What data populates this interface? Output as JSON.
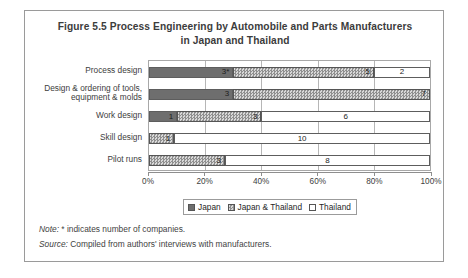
{
  "figure": {
    "title_line1": "Figure 5.5 Process Engineering by Automobile and Parts Manufacturers",
    "title_line2": "in Japan and Thailand"
  },
  "legend": {
    "items": [
      {
        "label": "Japan",
        "key": "japan",
        "swatch": "solid-dark"
      },
      {
        "label": "Japan & Thailand",
        "key": "japan_thailand",
        "swatch": "checkered"
      },
      {
        "label": "Thailand",
        "key": "thailand",
        "swatch": "white"
      }
    ]
  },
  "notes": {
    "note_lead": "Note:",
    "note_text": " * indicates number of companies.",
    "source_lead": "Source:",
    "source_text": " Compiled from authors' interviews with manufacturers."
  },
  "colors": {
    "japan": "#6e6e6e",
    "japan_thailand": "#b9b9b9",
    "thailand": "#ffffff",
    "frame": "#9a9a9a",
    "gridline": "#b6b6b6",
    "text": "#3d3d3d"
  },
  "chart_data": {
    "type": "bar",
    "orientation": "horizontal",
    "stacked": true,
    "normalized": true,
    "title": "Figure 5.5 Process Engineering by Automobile and Parts Manufacturers in Japan and Thailand",
    "xlabel": "",
    "ylabel": "",
    "xlim": [
      0,
      100
    ],
    "xticks": [
      0,
      20,
      40,
      60,
      80,
      100
    ],
    "xtick_labels": [
      "0%",
      "20%",
      "40%",
      "60%",
      "80%",
      "100%"
    ],
    "grid": true,
    "legend_position": "bottom-center",
    "categories": [
      "Process design",
      "Design & ordering of tools, equipment & molds",
      "Work design",
      "Skill design",
      "Pilot runs"
    ],
    "category_labels_wrapped": [
      [
        "Process design"
      ],
      [
        "Design & ordering of tools,",
        "equipment & molds"
      ],
      [
        "Work design"
      ],
      [
        "Skill design"
      ],
      [
        "Pilot runs"
      ]
    ],
    "series": [
      {
        "name": "Japan",
        "values": [
          3,
          3,
          1,
          0,
          0
        ],
        "labels": [
          "3*",
          "3",
          "1",
          "",
          ""
        ],
        "percent": [
          30,
          30,
          10,
          0,
          0
        ]
      },
      {
        "name": "Japan & Thailand",
        "values": [
          5,
          7,
          3,
          1,
          3
        ],
        "labels": [
          "5",
          "7",
          "3",
          "1",
          "3"
        ],
        "percent": [
          50,
          70,
          30,
          9,
          27
        ]
      },
      {
        "name": "Thailand",
        "values": [
          2,
          0,
          6,
          10,
          8
        ],
        "labels": [
          "2",
          "",
          "6",
          "10",
          "8"
        ],
        "percent": [
          20,
          0,
          60,
          91,
          73
        ]
      }
    ],
    "rows": [
      {
        "category": "Process design",
        "japan": "3*",
        "japan_thailand": "5",
        "thailand": "2",
        "total": 10
      },
      {
        "category": "Design & ordering of tools, equipment & molds",
        "japan": "3",
        "japan_thailand": "7",
        "thailand": "",
        "total": 10
      },
      {
        "category": "Work design",
        "japan": "1",
        "japan_thailand": "3",
        "thailand": "6",
        "total": 10
      },
      {
        "category": "Skill design",
        "japan": "",
        "japan_thailand": "1",
        "thailand": "10",
        "total": 11
      },
      {
        "category": "Pilot runs",
        "japan": "",
        "japan_thailand": "3",
        "thailand": "8",
        "total": 11
      }
    ]
  }
}
